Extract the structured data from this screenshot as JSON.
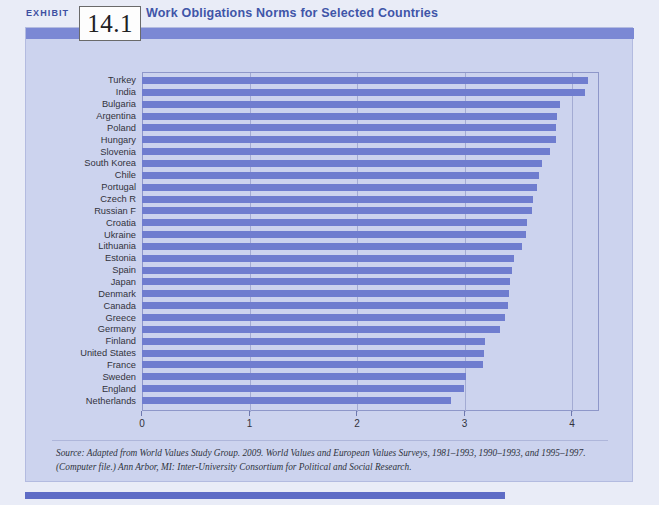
{
  "header": {
    "exhibit_label": "EXHIBIT",
    "exhibit_number": "14.1",
    "title": "Work Obligations Norms for Selected Countries"
  },
  "source_note": "Source: Adapted from World Values Study Group. 2009. World Values and European Values Surveys, 1981–1993, 1990–1993, and 1995–1997. (Computer file.) Ann Arbor, MI: Inter-University Consortium for Political and Social Research.",
  "colors": {
    "bar": "#6f7dcf",
    "plot_background": "#ccd3ee",
    "band": "#7b88d4",
    "title_text": "#4055a8",
    "gridline": "#a3abd3"
  },
  "chart_data": {
    "type": "bar",
    "orientation": "horizontal",
    "title": "Work Obligations Norms for Selected Countries",
    "xlabel": "",
    "ylabel": "",
    "xlim": [
      0,
      4.25
    ],
    "xticks": [
      0,
      1,
      2,
      3,
      4
    ],
    "xtick_labels": [
      "0",
      "1",
      "2",
      "3",
      "4"
    ],
    "grid": true,
    "legend": "none",
    "categories": [
      "Turkey",
      "India",
      "Bulgaria",
      "Argentina",
      "Poland",
      "Hungary",
      "Slovenia",
      "South Korea",
      "Chile",
      "Portugal",
      "Czech R",
      "Russian F",
      "Croatia",
      "Ukraine",
      "Lithuania",
      "Estonia",
      "Spain",
      "Japan",
      "Denmark",
      "Canada",
      "Greece",
      "Germany",
      "Finland",
      "United States",
      "France",
      "Sweden",
      "England",
      "Netherlands"
    ],
    "values": [
      4.15,
      4.12,
      3.89,
      3.86,
      3.85,
      3.85,
      3.79,
      3.72,
      3.69,
      3.67,
      3.64,
      3.63,
      3.58,
      3.57,
      3.53,
      3.46,
      3.44,
      3.42,
      3.41,
      3.4,
      3.38,
      3.33,
      3.19,
      3.18,
      3.17,
      3.01,
      2.99,
      2.87
    ]
  }
}
